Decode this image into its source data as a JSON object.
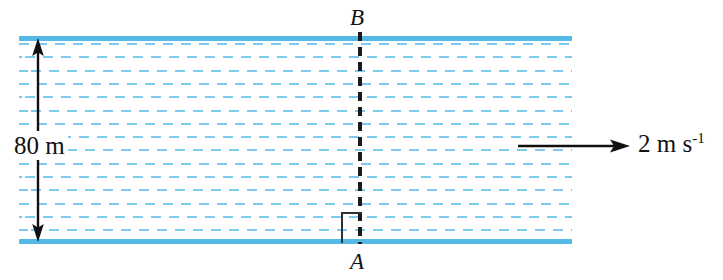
{
  "diagram": {
    "river": {
      "width_label": "80 m",
      "width_value": 80,
      "width_unit": "m",
      "flow_speed_value": 2,
      "flow_speed_label": "2 m s",
      "flow_speed_exponent": "-1",
      "flow_direction": "left-to-right",
      "bank_color": "#55b9e8",
      "current_line_color": "#7fc9ee"
    },
    "points": {
      "start": "A",
      "end": "B"
    },
    "markers": {
      "right_angle": "right-angle-marker",
      "width_arrow": "double-headed-vertical-arrow",
      "speed_arrow": "single-headed-horizontal-arrow"
    },
    "colors": {
      "ink": "#111111",
      "bank": "#55b9e8",
      "current": "#7fc9ee",
      "background": "#ffffff"
    }
  }
}
